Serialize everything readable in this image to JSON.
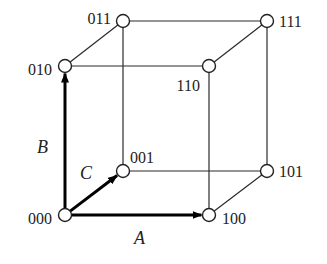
{
  "diagram": {
    "type": "binary-cube",
    "nodes": [
      {
        "id": "000",
        "label": "000",
        "x": 65,
        "y": 215,
        "lx": 52,
        "ly": 224,
        "anchor": "end"
      },
      {
        "id": "100",
        "label": "100",
        "x": 209,
        "y": 215,
        "lx": 222,
        "ly": 224,
        "anchor": "start"
      },
      {
        "id": "010",
        "label": "010",
        "x": 65,
        "y": 66,
        "lx": 52,
        "ly": 75,
        "anchor": "end"
      },
      {
        "id": "110",
        "label": "110",
        "x": 209,
        "y": 66,
        "lx": 200,
        "ly": 91,
        "anchor": "end"
      },
      {
        "id": "001",
        "label": "001",
        "x": 123,
        "y": 171,
        "lx": 130,
        "ly": 163,
        "anchor": "start"
      },
      {
        "id": "101",
        "label": "101",
        "x": 267,
        "y": 171,
        "lx": 279,
        "ly": 177,
        "anchor": "start"
      },
      {
        "id": "011",
        "label": "011",
        "x": 123,
        "y": 21,
        "lx": 111,
        "ly": 24,
        "anchor": "end"
      },
      {
        "id": "111",
        "label": "111",
        "x": 267,
        "y": 21,
        "lx": 279,
        "ly": 27,
        "anchor": "start"
      }
    ],
    "edges": [
      [
        "010",
        "110"
      ],
      [
        "011",
        "111"
      ],
      [
        "010",
        "011"
      ],
      [
        "110",
        "111"
      ],
      [
        "001",
        "101"
      ],
      [
        "100",
        "101"
      ],
      [
        "011",
        "001"
      ],
      [
        "111",
        "101"
      ],
      [
        "110",
        "100"
      ]
    ],
    "axes": [
      {
        "name": "A",
        "label": "A",
        "from": "000",
        "to": "100",
        "lx": 134,
        "ly": 244
      },
      {
        "name": "B",
        "label": "B",
        "from": "000",
        "to": "010",
        "lx": 37,
        "ly": 153
      },
      {
        "name": "C",
        "label": "C",
        "from": "000",
        "to": "001",
        "lx": 80,
        "ly": 179
      }
    ]
  }
}
